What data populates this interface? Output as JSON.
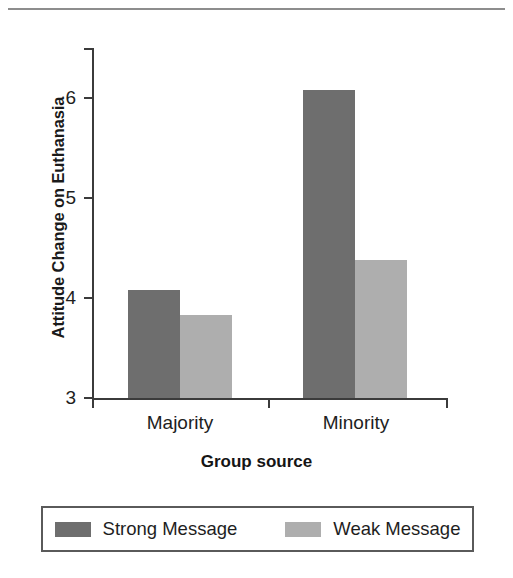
{
  "chart_data": {
    "type": "bar",
    "title": "",
    "xlabel": "Group source",
    "ylabel": "Attitude Change on Euthanasia",
    "categories": [
      "Majority",
      "Minority"
    ],
    "series": [
      {
        "name": "Strong Message",
        "values": [
          4.08,
          6.08
        ],
        "color": "#6e6e6e"
      },
      {
        "name": "Weak Message",
        "values": [
          3.83,
          4.38
        ],
        "color": "#aeaeae"
      }
    ],
    "ylim": [
      3,
      6.5
    ],
    "yticks": [
      3,
      4,
      5,
      6
    ],
    "ytick_labels": [
      "3",
      "4",
      "5",
      "6"
    ],
    "grid": false,
    "legend_position": "bottom"
  },
  "axes": {
    "y_title": "Attitude Change on Euthanasia",
    "x_title": "Group source",
    "y_labels": [
      "6",
      "5",
      "4",
      "3"
    ],
    "x_labels": [
      "Majority",
      "Minority"
    ]
  },
  "legend": {
    "entries": [
      {
        "label": "Strong Message",
        "color": "#6e6e6e"
      },
      {
        "label": "Weak Message",
        "color": "#aeaeae"
      }
    ]
  }
}
